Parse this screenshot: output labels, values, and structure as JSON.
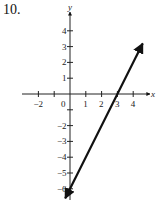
{
  "problem_number": "10.",
  "chart_data": {
    "type": "line",
    "title": "",
    "xlabel": "x",
    "ylabel": "y",
    "xlim": [
      -2.5,
      4.7
    ],
    "ylim": [
      -6.8,
      4.8
    ],
    "x_ticks": [
      -2,
      -1,
      0,
      1,
      2,
      3,
      4
    ],
    "x_tick_labels": [
      "-2",
      "0",
      "1",
      "2",
      "3",
      "4"
    ],
    "y_ticks": [
      -6,
      -5,
      -4,
      -3,
      -2,
      -1,
      1,
      2,
      3,
      4
    ],
    "y_tick_labels": [
      "4",
      "3",
      "2",
      "1",
      "-2",
      "-3",
      "-4",
      "-5",
      "-6"
    ],
    "grid": false,
    "series": [
      {
        "name": "y = 2x - 6",
        "x": [
          -0.3,
          3,
          4.6
        ],
        "y": [
          -6.6,
          0,
          3.2
        ],
        "arrows": "both"
      }
    ],
    "annotations": [
      "x-intercept 3",
      "y-intercept -6"
    ]
  }
}
